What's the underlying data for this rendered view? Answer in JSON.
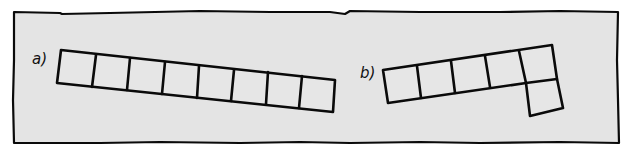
{
  "figure": {
    "background": "#ffffff",
    "panel_fill": "#e4e4e4",
    "ink_color": "#0a0a0a",
    "panels": [
      {
        "id": "a",
        "label": "a)",
        "cell_count": 8,
        "rows": 1,
        "description": "horizontal strip of 8 squares, slightly tilted downward to the right"
      },
      {
        "id": "b",
        "label": "b)",
        "cell_count": 6,
        "rows": 2,
        "description": "strip of 5 squares tilted upward to the right with one extra square attached below the last square"
      }
    ]
  }
}
